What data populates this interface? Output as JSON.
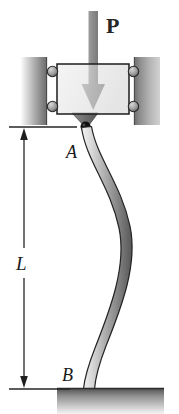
{
  "figure": {
    "background_color": "#ffffff"
  },
  "labels": {
    "load": "P",
    "top_support": "A",
    "base_support": "B",
    "length": "L"
  },
  "colors": {
    "outline": "#1a1a1a",
    "block_fill_light": "#e8e8e8",
    "block_fill_dark": "#c9c9c9",
    "wall_light": "#f2f2f2",
    "wall_dark": "#6e6e6e",
    "column_light": "#e2e2e2",
    "column_dark": "#5c5c5c",
    "arrow_gray": "#8a8a8a",
    "pin_dark": "#141414",
    "base_light": "#f0f0f0",
    "base_dark": "#4a4a4a",
    "dimension_line": "#2b2b2b"
  },
  "parts": {
    "load_arrow": "downward-load-arrow",
    "guide_wall_left": "left-guide-wall",
    "guide_wall_right": "right-guide-wall",
    "slider_block": "roller-guided-block",
    "rollers": [
      "roller-top-left",
      "roller-top-right",
      "roller-bottom-left",
      "roller-bottom-right"
    ],
    "pin_joint": "pin-joint-at-A",
    "column": "buckled-column",
    "base_plate": "fixed-base-plate",
    "dimension": "length-dimension-L"
  },
  "geometry": {
    "image_width": 179,
    "image_height": 414,
    "point_A": [
      85,
      127
    ],
    "point_B": [
      88,
      388
    ],
    "block_rect": [
      57,
      64,
      72,
      50
    ],
    "base_plate_rect": [
      57,
      388,
      107,
      26
    ],
    "dimension_x": 24,
    "dimension_top_y": 127,
    "dimension_bottom_y": 389
  }
}
